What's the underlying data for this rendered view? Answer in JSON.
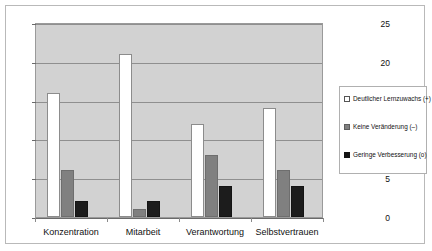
{
  "chart_data": {
    "type": "bar",
    "title": "",
    "xlabel": "",
    "ylabel": "",
    "ylim": [
      0,
      25
    ],
    "yticks": [
      0,
      5,
      10,
      15,
      20,
      25
    ],
    "grid": true,
    "legend_position": "right",
    "categories": [
      "Konzentration",
      "Mitarbeit",
      "Verantwortung",
      "Selbstvertrauen"
    ],
    "series": [
      {
        "name": "Deutlicher Lernzuwachs (+)",
        "color": "#ffffff",
        "values": [
          16,
          21,
          12,
          14
        ]
      },
      {
        "name": "Keine Veränderung (–)",
        "color": "#808080",
        "values": [
          6,
          1,
          8,
          6
        ]
      },
      {
        "name": "Geringe Verbesserung (o)",
        "color": "#1c1c1c",
        "values": [
          2,
          2,
          4,
          4
        ]
      }
    ]
  },
  "axis": {
    "ytick_labels": [
      "0",
      "5",
      "10",
      "15",
      "20",
      "25"
    ]
  },
  "legend": {
    "items": [
      {
        "label": "Deutlicher Lernzuwachs (+)"
      },
      {
        "label": "Keine Veränderung (–)"
      },
      {
        "label": "Geringe Verbesserung (o)"
      }
    ]
  },
  "colors": {
    "plot_background": "#d2d2d2",
    "gridline": "#8f8f8f",
    "frame_border": "#b9b9b9",
    "series_1": "#ffffff",
    "series_2": "#808080",
    "series_3": "#1c1c1c"
  }
}
